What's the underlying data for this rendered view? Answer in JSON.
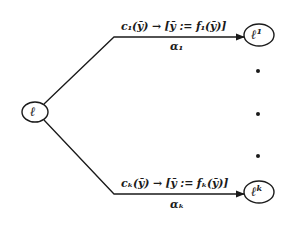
{
  "diagram": {
    "colors": {
      "stroke": "#1a1a1a",
      "background": "#ffffff"
    },
    "source_node": {
      "label": "ℓ"
    },
    "target_nodes": [
      {
        "label": "ℓ",
        "superscript": "1"
      },
      {
        "label": "ℓ",
        "superscript": "k"
      }
    ],
    "edges": [
      {
        "guard": "c₁(ȳ) → [ȳ := f₁(ȳ)]",
        "name": "α₁"
      },
      {
        "guard": "cₖ(ȳ) → [ȳ := fₖ(ȳ)]",
        "name": "αₖ"
      }
    ],
    "ellipsis_dots": 3
  }
}
